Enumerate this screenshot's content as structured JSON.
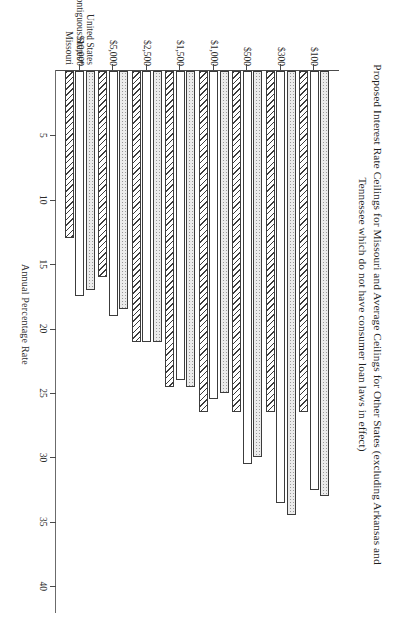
{
  "chart_data": {
    "type": "bar",
    "orientation": "horizontal",
    "title": "Proposed Interest Rate Ceilings for Missouri and Average Ceilings for Other States (excluding Arkansas and Tennessee which do not have consumer loan laws in effect)",
    "title_line1": "Proposed Interest Rate Ceilings for Missouri and Average Ceilings for Other States (excluding Arkansas and",
    "title_line2": "Tennessee which do not have consumer loan laws in effect)",
    "xlabel": "Loan Size",
    "ylabel": "Annual Percentage Rate",
    "categories": [
      "$100",
      "$300",
      "$500",
      "$1,000",
      "$1,500",
      "$2,500",
      "$5,000",
      "$10,000"
    ],
    "value_ticks": [
      5,
      10,
      15,
      20,
      25,
      30,
      35,
      40
    ],
    "value_tick_labels": [
      "5",
      "10",
      "15",
      "20",
      "25",
      "30",
      "35",
      "40"
    ],
    "ylim": [
      0,
      42
    ],
    "grid": false,
    "legend_position": "top-right",
    "series": [
      {
        "name": "Missouri",
        "pattern": "diagonal-hatch",
        "values": [
          26.5,
          26.5,
          26.5,
          26.5,
          24.5,
          21.0,
          16.0,
          13.0
        ]
      },
      {
        "name": "Contiguous States*",
        "pattern": "solid-white",
        "values": [
          32.5,
          33.5,
          30.5,
          25.5,
          24.0,
          21.0,
          19.0,
          17.5
        ]
      },
      {
        "name": "United States",
        "pattern": "light-stipple",
        "values": [
          33.0,
          34.5,
          30.0,
          25.0,
          24.5,
          21.0,
          18.5,
          17.0
        ]
      }
    ],
    "footnote_marker": "*"
  },
  "legend": {
    "items": [
      {
        "label": "Missouri"
      },
      {
        "label": "Contiguous States*"
      },
      {
        "label": "United States"
      }
    ]
  }
}
